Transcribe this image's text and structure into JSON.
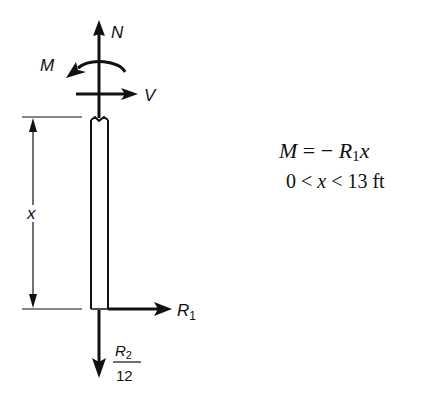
{
  "diagram": {
    "labels": {
      "normal_force": "N",
      "moment": "M",
      "shear": "V",
      "reaction_1": "R",
      "reaction_1_sub": "1",
      "reaction_2_num": "R",
      "reaction_2_sub": "2",
      "reaction_2_den": "12",
      "dimension": "x"
    },
    "colors": {
      "ink": "#111111",
      "background": "#ffffff"
    }
  },
  "equations": {
    "moment_lhs": "M",
    "moment_eq": " = − ",
    "moment_rhs_var": "R",
    "moment_rhs_sub": "1",
    "moment_rhs_x": "x",
    "range_low": "0 < ",
    "range_var": "x",
    "range_high": " < 13 ft"
  }
}
